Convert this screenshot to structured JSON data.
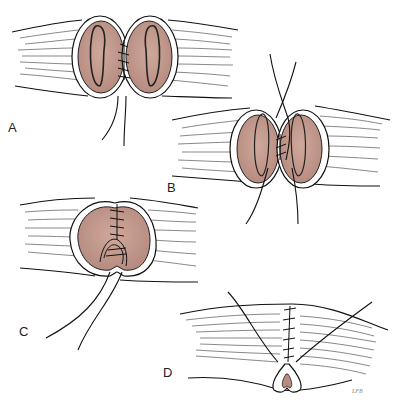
{
  "figure": {
    "colors": {
      "flesh": "#c9a095",
      "flesh_dark": "#b08478",
      "line": "#111111",
      "background": "#ffffff"
    },
    "panels": [
      {
        "id": "A",
        "label": "A"
      },
      {
        "id": "B",
        "label": "B"
      },
      {
        "id": "C",
        "label": "C"
      },
      {
        "id": "D",
        "label": "D"
      }
    ],
    "signature": "LFB"
  }
}
